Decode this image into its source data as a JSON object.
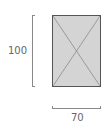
{
  "diagram": {
    "height_label": "100",
    "width_label": "70",
    "shape": "placeholder-rectangle",
    "colors": {
      "fill": "#d4d4d4",
      "border": "#555555",
      "dimension": "#888888"
    }
  }
}
